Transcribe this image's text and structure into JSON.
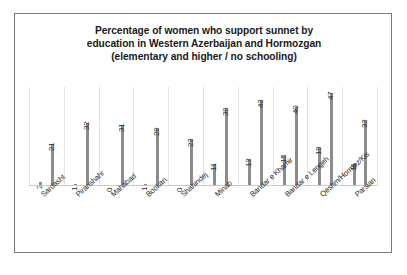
{
  "chart": {
    "title_lines": [
      "Percentage of women who support sunnet by",
      "education in Western Azerbaijan and Hormozgan",
      "(elementary and higher / no schooling)"
    ],
    "bar_color": "#8c8c8c",
    "grid_color": "#e2e2e2",
    "border_color": "#7a7a7a"
  },
  "chart_data": {
    "type": "bar",
    "title": "Percentage of women who support sunnet by education in Western Azerbaijan and Hormozgan (elementary and higher / no schooling)",
    "xlabel": "",
    "ylabel": "",
    "ylim": [
      0,
      50
    ],
    "grid": "vertical-category-separators",
    "legend": "none",
    "categories": [
      "Sardasht",
      "Piranshahr",
      "Mahabad",
      "Bookan",
      "Shahindej",
      "Minab",
      "Bandar e Khamir",
      "Bandar e Lengeh",
      "Qeshm/Hormoz/Kis",
      "Parsian"
    ],
    "series": [
      {
        "name": "elementary and higher",
        "values": [
          2,
          1,
          0,
          1,
          0,
          11,
          13,
          15,
          19,
          11
        ]
      },
      {
        "name": "no schooling",
        "values": [
          21,
          32,
          31,
          29,
          23,
          39,
          43,
          40,
          47,
          33
        ]
      }
    ],
    "data_labels": [
      "2",
      "21",
      "1",
      "32",
      "0",
      "31",
      "1",
      "29",
      "0",
      "23",
      "11",
      "39",
      "13",
      "43",
      "15",
      "40",
      "19",
      "47",
      "11",
      "33"
    ]
  }
}
